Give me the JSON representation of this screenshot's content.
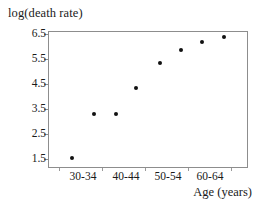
{
  "chart_data": {
    "type": "scatter",
    "title": "",
    "ylabel": "log(death rate)",
    "xlabel": "Age (years)",
    "categories": [
      "30-34",
      "35-39",
      "40-44",
      "45-49",
      "50-54",
      "55-59",
      "60-64",
      "65-69"
    ],
    "x_tick_labels": [
      "30-34",
      "40-44",
      "50-54",
      "60-64"
    ],
    "y_tick_labels": [
      "6.5",
      "5.5",
      "4.5",
      "3.5",
      "2.5",
      "1.5"
    ],
    "y_tick_values": [
      6.5,
      5.5,
      4.5,
      3.5,
      2.5,
      1.5
    ],
    "ylim": [
      1.25,
      6.75
    ],
    "grid": false,
    "legend": "none",
    "point_color": "#111111",
    "frame_color": "#8d8d8d",
    "points": [
      {
        "category": "30-34",
        "x_index": 0,
        "value": 1.7
      },
      {
        "category": "35-39",
        "x_index": 1,
        "value": 3.4
      },
      {
        "category": "40-44",
        "x_index": 2,
        "value": 3.4
      },
      {
        "category": "45-49",
        "x_index": 3,
        "value": 4.45
      },
      {
        "category": "50-54",
        "x_index": 4,
        "value": 5.4
      },
      {
        "category": "55-59",
        "x_index": 5,
        "value": 5.95
      },
      {
        "category": "60-64",
        "x_index": 6,
        "value": 6.25
      },
      {
        "category": "65-69",
        "x_index": 7,
        "value": 6.45
      }
    ],
    "point_positions": [
      {
        "left_pct": 12.0,
        "top_pct": 92.7
      },
      {
        "left_pct": 23.0,
        "top_pct": 60.6
      },
      {
        "left_pct": 34.0,
        "top_pct": 60.6
      },
      {
        "left_pct": 44.0,
        "top_pct": 41.6
      },
      {
        "left_pct": 56.0,
        "top_pct": 23.4
      },
      {
        "left_pct": 66.5,
        "top_pct": 13.9
      },
      {
        "left_pct": 77.0,
        "top_pct": 8.0
      },
      {
        "left_pct": 88.0,
        "top_pct": 4.4
      }
    ],
    "y_tick_positions_pct": [
      2.2,
      20.4,
      38.7,
      56.9,
      75.2,
      93.4
    ],
    "x_tick_label_positions_pct": [
      17.5,
      39.0,
      60.0,
      81.0
    ],
    "x_tick_mark_positions_pct": [
      5.5,
      27.0,
      48.5,
      70.0,
      91.5
    ]
  }
}
